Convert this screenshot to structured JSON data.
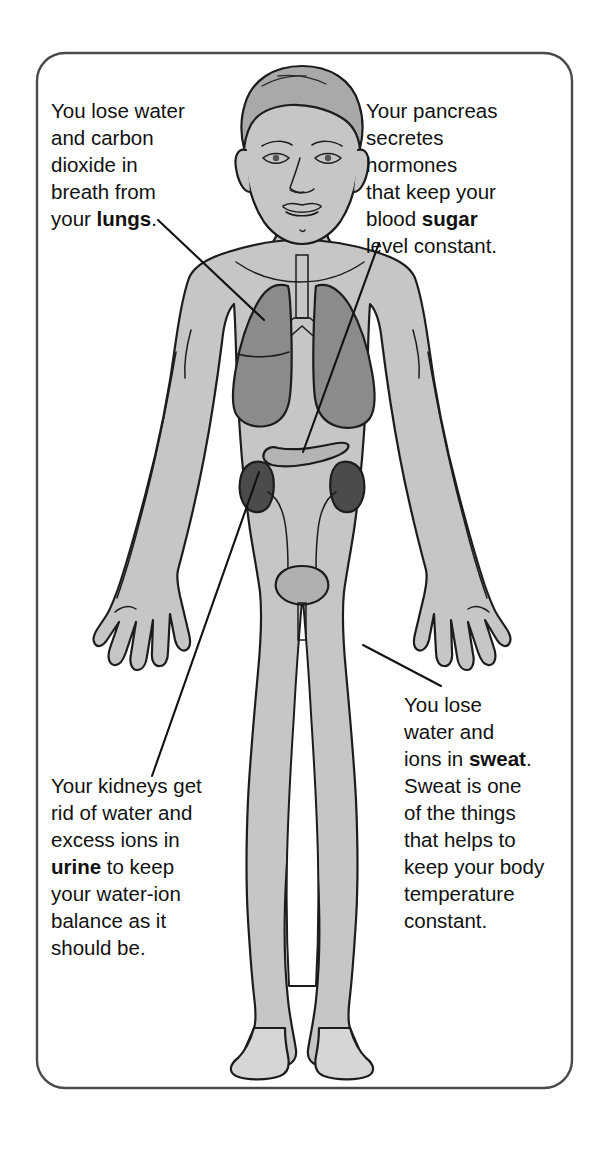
{
  "panel": {
    "border_color": "#4a4a4a",
    "background_color": "#ffffff",
    "corner_radius": 28
  },
  "palette": {
    "skin_fill": "#c6c6c6",
    "hair_fill": "#a9a9a9",
    "lung_fill": "#8b8b8b",
    "kidney_fill": "#4b4b4b",
    "pancreas_fill": "#b4b4b4",
    "bladder_fill": "#b0b0b0",
    "outline": "#1c1c1c",
    "text": "#111111"
  },
  "callouts": [
    {
      "id": "lungs",
      "name": "lungs-callout",
      "position": "top-left",
      "lines": [
        [
          {
            "t": "You lose water",
            "b": false
          }
        ],
        [
          {
            "t": "and carbon",
            "b": false
          }
        ],
        [
          {
            "t": "dioxide in",
            "b": false
          }
        ],
        [
          {
            "t": "breath from",
            "b": false
          }
        ],
        [
          {
            "t": "your ",
            "b": false
          },
          {
            "t": "lungs",
            "b": true
          },
          {
            "t": ".",
            "b": false
          }
        ]
      ],
      "plain_text": "You lose water and carbon dioxide in breath from your lungs.",
      "keyword": "lungs",
      "leader": {
        "x1": 158,
        "y1": 220,
        "x2": 264,
        "y2": 320
      }
    },
    {
      "id": "pancreas",
      "name": "pancreas-callout",
      "position": "top-right",
      "lines": [
        [
          {
            "t": "Your pancreas",
            "b": false
          }
        ],
        [
          {
            "t": "secretes",
            "b": false
          }
        ],
        [
          {
            "t": "hormones",
            "b": false
          }
        ],
        [
          {
            "t": "that keep your",
            "b": false
          }
        ],
        [
          {
            "t": "blood ",
            "b": false
          },
          {
            "t": "sugar",
            "b": true
          }
        ],
        [
          {
            "t": "level constant.",
            "b": false
          }
        ]
      ],
      "plain_text": "Your pancreas secretes hormones that keep your blood sugar level constant.",
      "keyword": "sugar",
      "leader": {
        "x1": 379,
        "y1": 243,
        "x2": 303,
        "y2": 452
      }
    },
    {
      "id": "kidneys",
      "name": "kidneys-callout",
      "position": "bottom-left",
      "lines": [
        [
          {
            "t": "Your kidneys get",
            "b": false
          }
        ],
        [
          {
            "t": "rid of water and",
            "b": false
          }
        ],
        [
          {
            "t": "excess ions in",
            "b": false
          }
        ],
        [
          {
            "t": "urine",
            "b": true
          },
          {
            "t": " to keep",
            "b": false
          }
        ],
        [
          {
            "t": "your water-ion",
            "b": false
          }
        ],
        [
          {
            "t": "balance as it",
            "b": false
          }
        ],
        [
          {
            "t": "should be.",
            "b": false
          }
        ]
      ],
      "plain_text": "Your kidneys get rid of water and excess ions in urine to keep your water-ion balance as it should be.",
      "keyword": "urine",
      "leader": {
        "x1": 152,
        "y1": 776,
        "x2": 259,
        "y2": 472
      }
    },
    {
      "id": "sweat",
      "name": "sweat-callout",
      "position": "bottom-right",
      "lines": [
        [
          {
            "t": "You lose",
            "b": false
          }
        ],
        [
          {
            "t": "water and",
            "b": false
          }
        ],
        [
          {
            "t": "ions in ",
            "b": false
          },
          {
            "t": "sweat",
            "b": true
          },
          {
            "t": ".",
            "b": false
          }
        ],
        [
          {
            "t": "Sweat is one",
            "b": false
          }
        ],
        [
          {
            "t": "of the things",
            "b": false
          }
        ],
        [
          {
            "t": "that helps to",
            "b": false
          }
        ],
        [
          {
            "t": "keep your body",
            "b": false
          }
        ],
        [
          {
            "t": "temperature",
            "b": false
          }
        ],
        [
          {
            "t": "constant.",
            "b": false
          }
        ]
      ],
      "plain_text": "You lose water and ions in sweat. Sweat is one of the things that helps to keep your body temperature constant.",
      "keyword": "sweat",
      "leader": {
        "x1": 363,
        "y1": 645,
        "x2": 441,
        "y2": 686
      }
    }
  ],
  "organs": [
    {
      "id": "lungs",
      "label": "lungs",
      "count": 2
    },
    {
      "id": "trachea",
      "label": "trachea and bronchi",
      "count": 1
    },
    {
      "id": "pancreas",
      "label": "pancreas",
      "count": 1
    },
    {
      "id": "kidneys",
      "label": "kidneys",
      "count": 2
    },
    {
      "id": "ureters",
      "label": "ureters",
      "count": 2
    },
    {
      "id": "bladder",
      "label": "bladder",
      "count": 1
    },
    {
      "id": "urethra",
      "label": "urethra",
      "count": 1
    }
  ]
}
